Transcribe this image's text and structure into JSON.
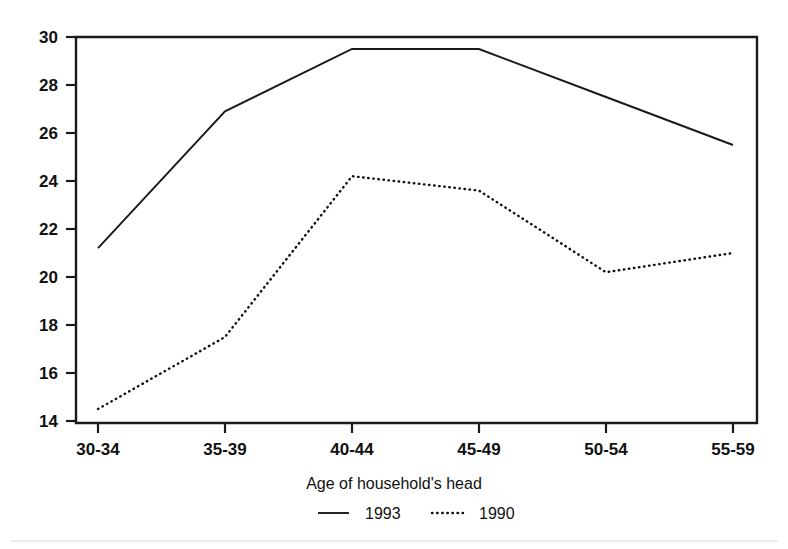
{
  "chart_data": {
    "type": "line",
    "title": "",
    "xlabel": "Age of household's head",
    "ylabel": "",
    "categories": [
      "30-34",
      "35-39",
      "40-44",
      "45-49",
      "50-54",
      "55-59"
    ],
    "series": [
      {
        "name": "1993",
        "style": "solid",
        "values": [
          21.2,
          26.9,
          29.5,
          29.5,
          27.5,
          25.5
        ]
      },
      {
        "name": "1990",
        "style": "dotted",
        "values": [
          14.5,
          17.5,
          24.2,
          23.6,
          20.2,
          21.0
        ]
      }
    ],
    "ylim": [
      13.5,
      30.0
    ],
    "yticks": [
      14,
      16,
      18,
      20,
      22,
      24,
      26,
      28,
      30
    ],
    "ytick_labels": [
      "14",
      "16",
      "18",
      "20",
      "22",
      "24",
      "26",
      "28",
      "30"
    ],
    "xtick_labels": [
      "30-34",
      "35-39",
      "40-44",
      "45-49",
      "50-54",
      "55-59"
    ],
    "grid": false,
    "legend_position": "bottom-center",
    "legend_entries": [
      {
        "label": "1993",
        "style": "solid"
      },
      {
        "label": "1990",
        "style": "dotted"
      }
    ],
    "colors": {
      "line": "#1a1a1a",
      "text": "#111111",
      "background": "#ffffff"
    }
  }
}
